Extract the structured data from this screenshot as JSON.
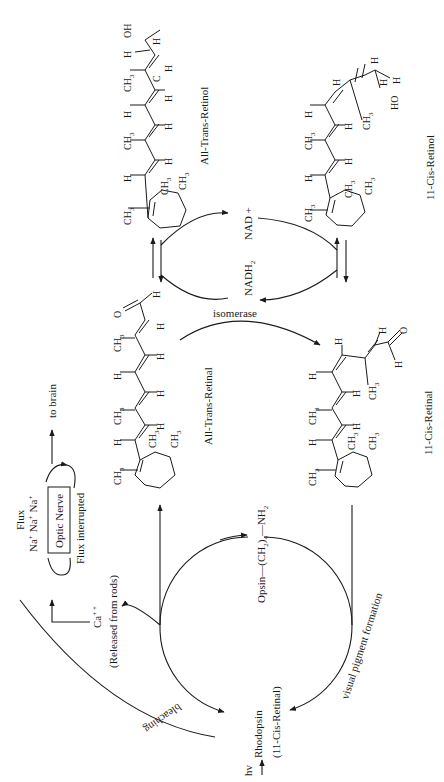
{
  "figure": {
    "orientation": "rotated 90° counter-clockwise",
    "compounds": {
      "all_trans_retinol": {
        "label": "All-Trans-Retinol"
      },
      "cis_retinol": {
        "label": "11-Cis-Retinol"
      },
      "all_trans_retinal": {
        "label": "All-Trans-Retinal"
      },
      "cis_retinal": {
        "label": "11-Cis-Retinal"
      }
    },
    "cofactors": {
      "nad": "NAD +",
      "nadh": "NADH",
      "nadh_sub": "2"
    },
    "enzymes": {
      "isomerase": "isomerase"
    },
    "cycle": {
      "opsin": "Opsin—(CH",
      "opsin_sub": "2",
      "opsin_tail": ")",
      "opsin_sub2": "4",
      "opsin_end": "—NH",
      "opsin_end_sub": "2",
      "rhodopsin": "Rhodopsin",
      "rhodopsin_sub": "(11-Cis-Retinal)",
      "hv": "hv",
      "bleaching": "bleaching",
      "visual_pigment": "visual pigment formation"
    },
    "signal": {
      "ca": "Ca",
      "ca_charge": "+ +",
      "ca_note": "(Released from rods)",
      "flux": "Flux",
      "na": "Na",
      "na_charge": "+",
      "optic_nerve": "Optic Nerve",
      "flux_interrupted": "Flux interrupted",
      "to_brain": "to brain"
    },
    "atoms": {
      "ch3": "CH",
      "ch3_sub": "3",
      "h": "H",
      "o": "O",
      "oh": "OH",
      "ho": "HO",
      "c": "C"
    }
  }
}
